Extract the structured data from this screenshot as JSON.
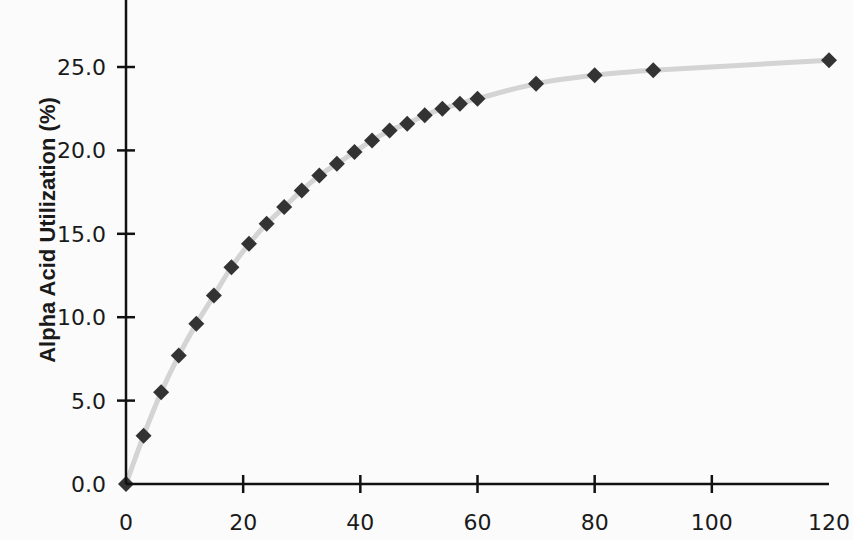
{
  "chart_data": {
    "type": "line",
    "title": "",
    "xlabel": "",
    "ylabel": "Alpha Acid Utilization (%)",
    "xlim": [
      0,
      120
    ],
    "ylim": [
      0,
      28
    ],
    "x_ticks": [
      0,
      20,
      40,
      60,
      80,
      100,
      120
    ],
    "x_tick_labels": [
      "0",
      "20",
      "40",
      "60",
      "80",
      "100",
      "120"
    ],
    "y_ticks": [
      0,
      5,
      10,
      15,
      20,
      25
    ],
    "y_tick_labels": [
      "0.0",
      "5.0",
      "10.0",
      "15.0",
      "20.0",
      "25.0"
    ],
    "grid": false,
    "legend": null,
    "series": [
      {
        "name": "Alpha Acid Utilization",
        "marker": "diamond",
        "marker_color": "#333333",
        "line_color": "#d4d4d4",
        "x": [
          0,
          3,
          6,
          9,
          12,
          15,
          18,
          21,
          24,
          27,
          30,
          33,
          36,
          39,
          42,
          45,
          48,
          51,
          54,
          57,
          60,
          70,
          80,
          90,
          120
        ],
        "values": [
          0.0,
          2.9,
          5.5,
          7.7,
          9.6,
          11.3,
          13.0,
          14.4,
          15.6,
          16.6,
          17.6,
          18.5,
          19.2,
          19.9,
          20.6,
          21.2,
          21.6,
          22.1,
          22.5,
          22.8,
          23.1,
          24.0,
          24.5,
          24.8,
          25.4
        ]
      }
    ]
  },
  "colors": {
    "background": "#fbfbfb",
    "axis": "#111111",
    "curve": "#d4d4d4",
    "marker": "#333333"
  }
}
